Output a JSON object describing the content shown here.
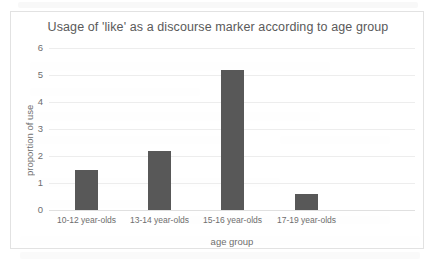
{
  "chart_data": {
    "type": "bar",
    "title": "Usage of 'like' as a discourse marker according to age group",
    "xlabel": "age group",
    "ylabel": "proportion of use",
    "categories": [
      "10-12 year-olds",
      "13-14 year-olds",
      "15-16 year-olds",
      "17-19 year-olds"
    ],
    "values": [
      1.5,
      2.2,
      5.2,
      0.6
    ],
    "ylim": [
      0,
      6
    ],
    "yticks": [
      "0",
      "1",
      "2",
      "3",
      "4",
      "5",
      "6"
    ],
    "ytick_values": [
      0,
      1,
      2,
      3,
      4,
      5,
      6
    ],
    "grid": true,
    "legend": "none",
    "bar_color": "#585858",
    "gridline_color": "#ededed",
    "frame_color": "#e2e2e2",
    "text_color": "#6e6e6e"
  }
}
